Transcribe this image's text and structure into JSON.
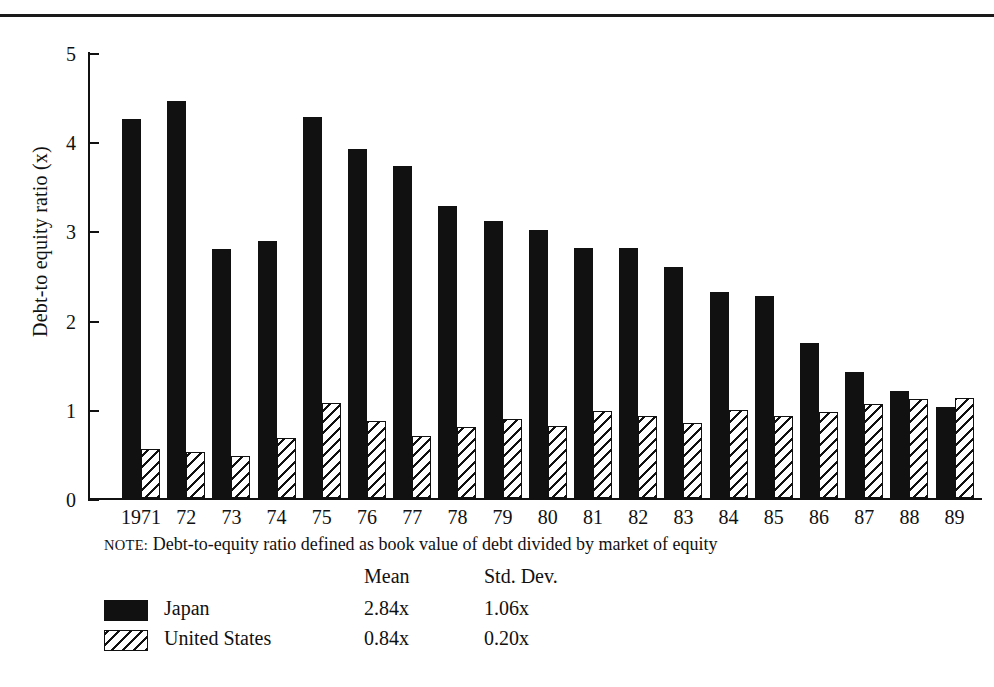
{
  "chart_data": {
    "type": "bar",
    "title": "",
    "subtitle": "",
    "xlabel": "",
    "ylabel": "Debt-to equity ratio (x)",
    "ylim": [
      0,
      5
    ],
    "yticks": [
      0,
      1,
      2,
      3,
      4,
      5
    ],
    "ytick_labels": [
      "0",
      "1",
      "2",
      "3",
      "4",
      "5"
    ],
    "grid": false,
    "legend_position": "below-plot",
    "categories": [
      "1971",
      "72",
      "73",
      "74",
      "75",
      "76",
      "77",
      "78",
      "79",
      "80",
      "81",
      "82",
      "83",
      "84",
      "85",
      "86",
      "87",
      "88",
      "89"
    ],
    "series": [
      {
        "name": "Japan",
        "fill": "solid-black",
        "color": "#111111",
        "values": [
          4.25,
          4.45,
          2.79,
          2.88,
          4.27,
          3.91,
          3.72,
          3.27,
          3.1,
          3.01,
          2.8,
          2.8,
          2.59,
          2.31,
          2.26,
          1.74,
          1.41,
          1.2,
          1.02
        ]
      },
      {
        "name": "United States",
        "fill": "diagonal-hatch",
        "color": "#111111",
        "values": [
          0.55,
          0.52,
          0.47,
          0.67,
          1.07,
          0.86,
          0.7,
          0.8,
          0.89,
          0.81,
          0.98,
          0.92,
          0.84,
          0.99,
          0.92,
          0.96,
          1.05,
          1.11,
          1.12
        ]
      }
    ],
    "note": "NOTE: Debt-to-equity ratio defined as book value of debt divided by market of equity",
    "note_prefix": "NOTE:",
    "note_body": "Debt-to-equity ratio defined as book value of debt divided by market of equity",
    "stats_table": {
      "headers": [
        "",
        "",
        "Mean",
        "Std. Dev."
      ],
      "rows": [
        {
          "swatch": "solid-black",
          "name": "Japan",
          "mean": "2.84x",
          "std_dev": "1.06x"
        },
        {
          "swatch": "diagonal-hatch",
          "name": "United States",
          "mean": "0.84x",
          "std_dev": "0.20x"
        }
      ]
    }
  },
  "axis": {
    "y_label": "Debt-to equity ratio (x)",
    "y_ticks": [
      "5",
      "4",
      "3",
      "2",
      "1",
      "0"
    ],
    "x_ticks": [
      "1971",
      "72",
      "73",
      "74",
      "75",
      "76",
      "77",
      "78",
      "79",
      "80",
      "81",
      "82",
      "83",
      "84",
      "85",
      "86",
      "87",
      "88",
      "89"
    ]
  },
  "note": {
    "prefix": "NOTE:",
    "text": "Debt-to-equity ratio defined as book value of debt divided by market of equity"
  },
  "legend": {
    "header": {
      "mean": "Mean",
      "std_dev": "Std. Dev."
    },
    "rows": [
      {
        "name": "Japan",
        "mean": "2.84x",
        "std_dev": "1.06x"
      },
      {
        "name": "United States",
        "mean": "0.84x",
        "std_dev": "0.20x"
      }
    ]
  }
}
